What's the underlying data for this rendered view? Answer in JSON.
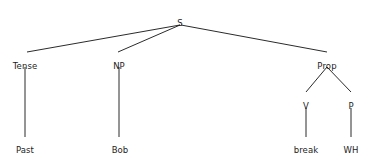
{
  "diagram": {
    "type": "syntax-parse-tree",
    "title": "",
    "background_color": "#ffffff",
    "line_color": "#2b2b2b",
    "text_color": "#1d1d1d",
    "line_width": 1,
    "nodes": [
      {
        "id": "s",
        "label": "S",
        "x": 180,
        "y": 18,
        "role": "root"
      },
      {
        "id": "tense",
        "label": "Tense",
        "x": 25,
        "y": 61,
        "role": "category"
      },
      {
        "id": "np",
        "label": "NP",
        "x": 119,
        "y": 61,
        "role": "category"
      },
      {
        "id": "prop",
        "label": "Prop",
        "x": 327,
        "y": 61,
        "role": "category"
      },
      {
        "id": "v",
        "label": "V",
        "x": 306,
        "y": 101,
        "role": "category"
      },
      {
        "id": "p",
        "label": "P",
        "x": 351,
        "y": 101,
        "role": "category"
      },
      {
        "id": "past",
        "label": "Past",
        "x": 25,
        "y": 145,
        "role": "leaf"
      },
      {
        "id": "bob",
        "label": "Bob",
        "x": 120,
        "y": 145,
        "role": "leaf"
      },
      {
        "id": "break",
        "label": "break",
        "x": 306,
        "y": 145,
        "role": "leaf"
      },
      {
        "id": "wh",
        "label": "WH",
        "x": 351,
        "y": 145,
        "role": "leaf"
      }
    ],
    "edges": [
      {
        "id": "s-tense",
        "from": "s",
        "to": "tense",
        "x1": 180,
        "y1": 25,
        "x2": 27,
        "y2": 52
      },
      {
        "id": "s-np",
        "from": "s",
        "to": "np",
        "x1": 180,
        "y1": 25,
        "x2": 118,
        "y2": 52
      },
      {
        "id": "s-prop",
        "from": "s",
        "to": "prop",
        "x1": 181,
        "y1": 25,
        "x2": 327,
        "y2": 52
      },
      {
        "id": "tense-past",
        "from": "tense",
        "to": "past",
        "x1": 25,
        "y1": 67,
        "x2": 25,
        "y2": 137
      },
      {
        "id": "np-bob",
        "from": "np",
        "to": "bob",
        "x1": 119,
        "y1": 67,
        "x2": 119,
        "y2": 137
      },
      {
        "id": "prop-v",
        "from": "prop",
        "to": "v",
        "x1": 327,
        "y1": 67,
        "x2": 306,
        "y2": 92
      },
      {
        "id": "prop-p",
        "from": "prop",
        "to": "p",
        "x1": 327,
        "y1": 67,
        "x2": 351,
        "y2": 92
      },
      {
        "id": "v-break",
        "from": "v",
        "to": "break",
        "x1": 306,
        "y1": 108,
        "x2": 306,
        "y2": 137
      },
      {
        "id": "p-wh",
        "from": "p",
        "to": "wh",
        "x1": 351,
        "y1": 108,
        "x2": 351,
        "y2": 137
      }
    ]
  }
}
